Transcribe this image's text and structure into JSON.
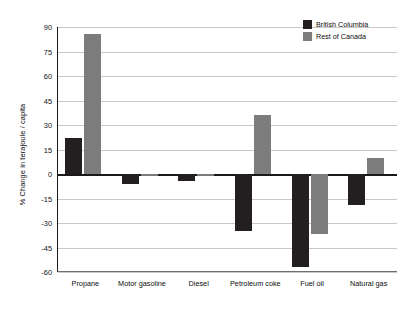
{
  "chart_data": {
    "type": "bar",
    "title": "",
    "xlabel": "",
    "ylabel": "% Change in terajoule / capita",
    "ylim": [
      -60,
      90
    ],
    "ytick_step": 15,
    "yticks": [
      90,
      75,
      60,
      45,
      30,
      15,
      0,
      -15,
      -30,
      -45,
      -60
    ],
    "ytick_labels": [
      "90",
      "75",
      "60",
      "45",
      "30",
      "15",
      "0",
      "-15",
      "-30",
      "-45",
      "-60"
    ],
    "categories": [
      "Propane",
      "Motor gasoline",
      "Diesel",
      "Petroleum coke",
      "Fuel oil",
      "Natural gas"
    ],
    "series": [
      {
        "name": "British Columbia",
        "color": "#231f20",
        "values": [
          22,
          -6,
          -4,
          -35,
          -57,
          -19
        ]
      },
      {
        "name": "Rest of Canada",
        "color": "#7c7c7c",
        "values": [
          86,
          -1.5,
          -1,
          36,
          -37,
          10
        ]
      }
    ],
    "grid": true,
    "legend_position": "top-right",
    "zero_line": true
  },
  "legend": {
    "items": [
      {
        "label": "British Columbia",
        "color": "#231f20"
      },
      {
        "label": "Rest of Canada",
        "color": "#7c7c7c"
      }
    ]
  }
}
